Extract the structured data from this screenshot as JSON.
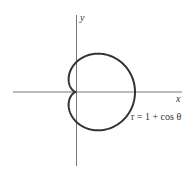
{
  "figure": {
    "x_axis_label": "x",
    "y_axis_label": "y",
    "equation_label": "r = 1 + cos θ",
    "curve_color": "#333333",
    "axis_color": "#555555"
  },
  "geometry": {
    "origin": [
      76,
      92
    ],
    "scale_px_per_unit": 29.5,
    "x_axis_extent": [
      13,
      182
    ],
    "y_axis_extent": [
      15,
      166
    ]
  },
  "curve": {
    "type": "cardioid",
    "polar_equation": "r = 1 + cos θ",
    "a": 1
  }
}
